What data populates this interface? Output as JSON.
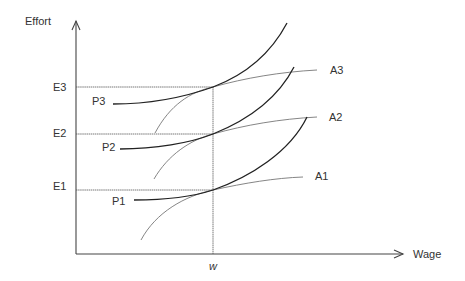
{
  "diagram": {
    "axes": {
      "y_label": "Effort",
      "x_label": "Wage",
      "x_marker": "w"
    },
    "effort_levels": [
      {
        "label": "E3"
      },
      {
        "label": "E2"
      },
      {
        "label": "E1"
      }
    ],
    "p_curves": [
      {
        "label": "P3"
      },
      {
        "label": "P2"
      },
      {
        "label": "P1"
      }
    ],
    "a_curves": [
      {
        "label": "A3"
      },
      {
        "label": "A2"
      },
      {
        "label": "A1"
      }
    ],
    "colors": {
      "p_curve": "#222222",
      "a_curve": "#777777",
      "axis": "#444444"
    }
  }
}
